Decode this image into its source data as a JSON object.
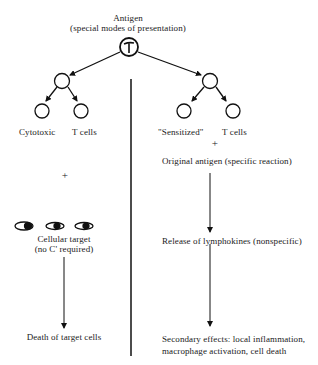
{
  "diagram": {
    "root": {
      "title": "Antigen",
      "subtitle": "(special modes of presentation)",
      "node_label": "T"
    },
    "left_branch": {
      "cell_label_1": "Cytotoxic",
      "cell_label_2": "T cells",
      "plus": "+",
      "target_label": "Cellular target",
      "target_note": "(no C' required)",
      "outcome": "Death of target cells"
    },
    "right_branch": {
      "cell_label_1": "\"Sensitized\"",
      "cell_label_2": "T cells",
      "plus": "+",
      "step_1": "Original antigen (specific reaction)",
      "step_2": "Release of lymphokines (nonspecific)",
      "outcome_line_1": "Secondary effects:  local inflammation,",
      "outcome_line_2": "macrophage activation, cell death"
    }
  }
}
